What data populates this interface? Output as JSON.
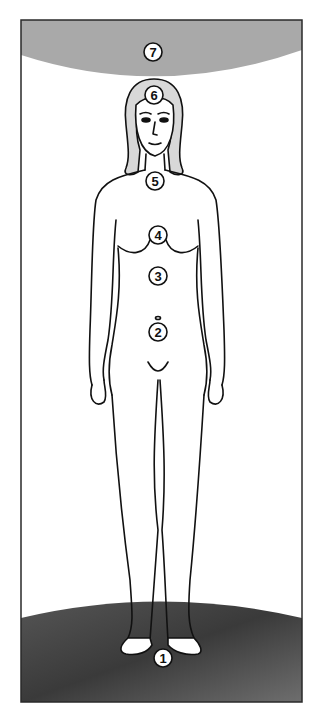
{
  "diagram": {
    "colors": {
      "frame": "#2a2a2a",
      "sky_arc": "#a9a9a9",
      "ground_dark": "#3a3a3a",
      "ground_light": "#8a8a8a",
      "outline": "#111111",
      "marker_fill": "#ffffff",
      "marker_stroke": "#111111"
    },
    "markers": [
      {
        "id": "1",
        "label": "1",
        "cx": 163,
        "cy": 658,
        "location": "feet / ground"
      },
      {
        "id": "2",
        "label": "2",
        "cx": 158,
        "cy": 332,
        "location": "lower abdomen"
      },
      {
        "id": "3",
        "label": "3",
        "cx": 158,
        "cy": 276,
        "location": "solar plexus"
      },
      {
        "id": "4",
        "label": "4",
        "cx": 158,
        "cy": 235,
        "location": "heart / chest"
      },
      {
        "id": "5",
        "label": "5",
        "cx": 155,
        "cy": 181,
        "location": "throat"
      },
      {
        "id": "6",
        "label": "6",
        "cx": 154,
        "cy": 95,
        "location": "forehead"
      },
      {
        "id": "7",
        "label": "7",
        "cx": 153,
        "cy": 52,
        "location": "above head"
      }
    ]
  }
}
